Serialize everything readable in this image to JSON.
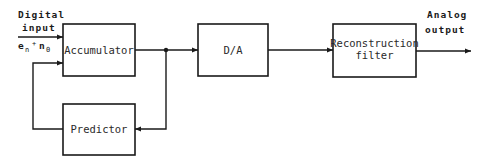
{
  "diagram": {
    "input": {
      "line1": "Digital",
      "line2": "input",
      "signal_e": "e",
      "signal_e_sub": "n",
      "signal_plus": "+",
      "signal_n": "n",
      "signal_n_sub": "0"
    },
    "blocks": {
      "accumulator": "Accumulator",
      "predictor": "Predictor",
      "da": "D/A",
      "reconstruction_line1": "Reconstruction",
      "reconstruction_line2": "filter"
    },
    "output": {
      "line1": "Analog",
      "line2": "output"
    },
    "colors": {
      "stroke": "#1a1a1a",
      "background": "#ffffff"
    }
  }
}
